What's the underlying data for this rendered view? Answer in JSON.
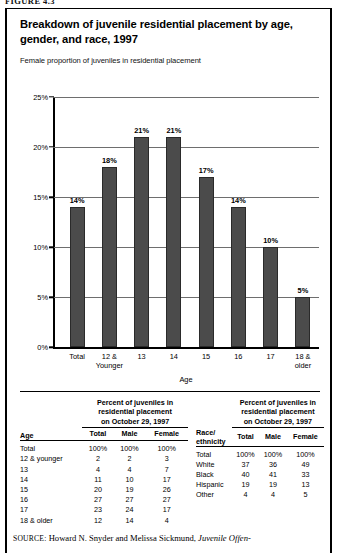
{
  "figure_label": "FIGURE 4.3",
  "chart": {
    "title": "Breakdown of juvenile residential placement by age, gender, and race, 1997",
    "subtitle": "Female proportion of juveniles in residential placement",
    "xaxis_title": "Age"
  },
  "chart_data": {
    "type": "bar",
    "title": "Breakdown of juvenile residential placement by age, gender, and race, 1997",
    "subtitle": "Female proportion of juveniles in residential placement",
    "xlabel": "Age",
    "ylabel": "",
    "ylim": [
      0,
      25
    ],
    "ytick_labels": [
      "0%",
      "5%",
      "10%",
      "15%",
      "20%",
      "25%"
    ],
    "ytick_values": [
      0,
      5,
      10,
      15,
      20,
      25
    ],
    "grid": true,
    "legend": "none",
    "categories": [
      "Total",
      "12 & Younger",
      "13",
      "14",
      "15",
      "16",
      "17",
      "18 & older"
    ],
    "category_lines": [
      [
        "Total"
      ],
      [
        "12 &",
        "Younger"
      ],
      [
        "13"
      ],
      [
        "14"
      ],
      [
        "15"
      ],
      [
        "16"
      ],
      [
        "17"
      ],
      [
        "18 &",
        "older"
      ]
    ],
    "values": [
      14,
      18,
      21,
      21,
      17,
      14,
      10,
      5
    ],
    "data_labels": [
      "14%",
      "18%",
      "21%",
      "21%",
      "17%",
      "14%",
      "10%",
      "5%"
    ],
    "bar_color": "#4b4b4b"
  },
  "table_age": {
    "row_header": "Age",
    "span_header_lines": [
      "Percent of juveniles in",
      "residential placement",
      "on October 29, 1997"
    ],
    "columns": [
      "Total",
      "Male",
      "Female"
    ],
    "rows": [
      {
        "label": "Total",
        "total": "100%",
        "male": "100%",
        "female": "100%"
      },
      {
        "label": "12 & younger",
        "total": "2",
        "male": "2",
        "female": "3"
      },
      {
        "label": "13",
        "total": "4",
        "male": "4",
        "female": "7"
      },
      {
        "label": "14",
        "total": "11",
        "male": "10",
        "female": "17"
      },
      {
        "label": "15",
        "total": "20",
        "male": "19",
        "female": "26"
      },
      {
        "label": "16",
        "total": "27",
        "male": "27",
        "female": "27"
      },
      {
        "label": "17",
        "total": "23",
        "male": "24",
        "female": "17"
      },
      {
        "label": "18 & older",
        "total": "12",
        "male": "14",
        "female": "4"
      }
    ]
  },
  "table_race": {
    "row_header_lines": [
      "Race/",
      "ethnicity"
    ],
    "span_header_lines": [
      "Percent of juveniles in",
      "residential placement",
      "on October 29, 1997"
    ],
    "columns": [
      "Total",
      "Male",
      "Female"
    ],
    "rows": [
      {
        "label": "Total",
        "total": "100%",
        "male": "100%",
        "female": "100%"
      },
      {
        "label": "White",
        "total": "37",
        "male": "36",
        "female": "49"
      },
      {
        "label": "Black",
        "total": "40",
        "male": "41",
        "female": "33"
      },
      {
        "label": "Hispanic",
        "total": "19",
        "male": "19",
        "female": "13"
      },
      {
        "label": "Other",
        "total": "4",
        "male": "4",
        "female": "5"
      }
    ]
  },
  "source": {
    "label": "SOURCE:",
    "text_before": " Howard N. Snyder and Melissa Sickmund, ",
    "title": "Juvenile Offen-"
  }
}
